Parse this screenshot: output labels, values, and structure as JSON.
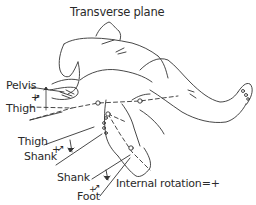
{
  "title": "Transverse plane",
  "labels": {
    "pelvis": "Pelvis",
    "plus_pelvis_thigh": "+",
    "thigh_1": "Thigh",
    "thigh_2": "Thigh",
    "plus_thigh_shank": "+",
    "shank_1": "Shank",
    "shank_2": "Shank",
    "plus_shank_foot": "+",
    "foot": "Foot",
    "legend": "Internal rotation=+"
  },
  "colors": {
    "line": "#333333",
    "background": "#ffffff"
  },
  "figure": {
    "joint_markers": [
      "hip",
      "knee",
      "ankle"
    ]
  }
}
